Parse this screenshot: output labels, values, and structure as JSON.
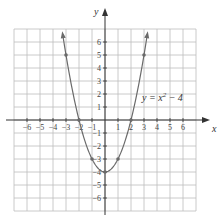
{
  "chart_data": {
    "type": "line",
    "title": "",
    "equation_label": "y = x² − 4",
    "equation_parts": {
      "lhs": "y = x",
      "exponent": "2",
      "rhs": " − 4"
    },
    "xlabel": "x",
    "ylabel": "y",
    "xlim": [
      -7,
      7
    ],
    "ylim": [
      -7,
      7
    ],
    "grid": true,
    "x_ticks": [
      -6,
      -5,
      -4,
      -3,
      -2,
      -1,
      1,
      2,
      3,
      4,
      5,
      6
    ],
    "y_ticks": [
      -6,
      -5,
      -4,
      -3,
      -2,
      -1,
      1,
      2,
      3,
      4,
      5,
      6
    ],
    "x_tick_labels": [
      "−6",
      "−5",
      "−4",
      "−3",
      "−2",
      "−1",
      "1",
      "2",
      "3",
      "4",
      "5",
      "6"
    ],
    "y_tick_labels_pos": [
      "1",
      "2",
      "3",
      "4",
      "5",
      "6"
    ],
    "y_tick_labels_neg": [
      "−1",
      "−2",
      "−3",
      "−4",
      "−5",
      "−6"
    ],
    "series": [
      {
        "name": "y = x^2 - 4",
        "x": [
          -3,
          -2,
          -1,
          0,
          1,
          2,
          3
        ],
        "y": [
          5,
          0,
          -3,
          -4,
          -3,
          0,
          5
        ],
        "marked_points": [
          [
            -3,
            5
          ],
          [
            -2,
            0
          ],
          [
            -1,
            -3
          ],
          [
            0,
            -4
          ],
          [
            1,
            -3
          ],
          [
            2,
            0
          ],
          [
            3,
            5
          ]
        ]
      }
    ],
    "colors": {
      "grid": "#bdbdbd",
      "axis": "#333333",
      "curve": "#6a6a6a"
    }
  }
}
